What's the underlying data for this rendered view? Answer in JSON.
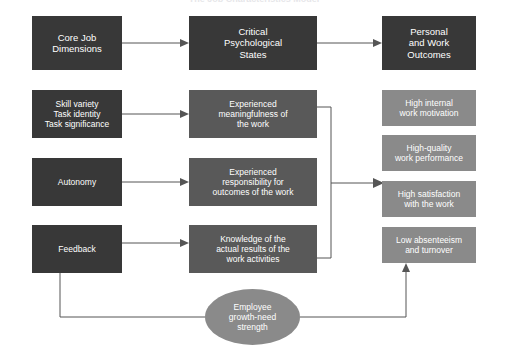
{
  "title": "The Job Characteristics Model",
  "headers": [
    {
      "label": "Core Job\nDimensions"
    },
    {
      "label": "Critical\nPsychological\nStates"
    },
    {
      "label": "Personal\nand Work\nOutcomes"
    }
  ],
  "core_job_dimensions": [
    {
      "label": "Skill variety\nTask identity\nTask significance"
    },
    {
      "label": "Autonomy"
    },
    {
      "label": "Feedback"
    }
  ],
  "psychological_states": [
    {
      "label": "Experienced\nmeaningfulness of\nthe work"
    },
    {
      "label": "Experienced\nresponsibility for\noutcomes of the work"
    },
    {
      "label": "Knowledge of the\nactual results of the\nwork activities"
    }
  ],
  "outcomes": [
    {
      "label": "High internal\nwork motivation"
    },
    {
      "label": "High-quality\nwork performance"
    },
    {
      "label": "High satisfaction\nwith the work"
    },
    {
      "label": "Low absenteeism\nand turnover"
    }
  ],
  "moderator": {
    "label": "Employee\ngrowth-need\nstrength"
  },
  "colors": {
    "dark_box": "#383838",
    "mid_box": "#595959",
    "light_box": "#8a8a8a",
    "connector": "#555555",
    "background": "#ffffff",
    "text": "#ffffff"
  }
}
